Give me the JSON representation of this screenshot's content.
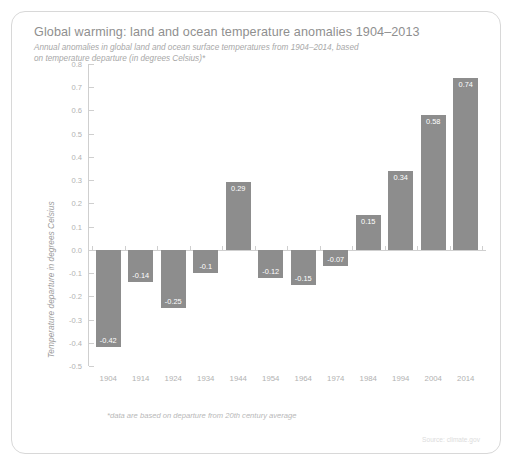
{
  "chart_data": {
    "type": "bar",
    "title": "Global warming: land and ocean temperature anomalies 1904–2013",
    "subtitle": "Annual anomalies in global land and ocean surface temperatures from 1904–2014, based on temperature departure (in degrees Celsius)*",
    "xlabel": "",
    "ylabel": "Temperature departure in degrees Celsius",
    "categories": [
      "1904",
      "1914",
      "1924",
      "1934",
      "1944",
      "1954",
      "1964",
      "1974",
      "1984",
      "1994",
      "2004",
      "2014"
    ],
    "values": [
      -0.42,
      -0.14,
      -0.25,
      -0.1,
      0.29,
      -0.12,
      -0.15,
      -0.07,
      0.15,
      0.34,
      0.58,
      0.74
    ],
    "value_labels": [
      "-0.42",
      "-0.14",
      "-0.25",
      "-0.1",
      "0.29",
      "-0.12",
      "-0.15",
      "-0.07",
      "0.15",
      "0.34",
      "0.58",
      "0.74"
    ],
    "ylim": [
      -0.5,
      0.8
    ],
    "ytick_labels": [
      "0.8",
      "0.7",
      "0.6",
      "0.5",
      "0.4",
      "0.3",
      "0.2",
      "0.1",
      "0.0",
      "-0.1",
      "-0.2",
      "-0.3",
      "-0.4",
      "-0.5"
    ],
    "ytick_values": [
      0.8,
      0.7,
      0.6,
      0.5,
      0.4,
      0.3,
      0.2,
      0.1,
      0.0,
      -0.1,
      -0.2,
      -0.3,
      -0.4,
      -0.5
    ],
    "grid": false,
    "legend": false,
    "bar_color": "#8d8d8d",
    "value_label_color": "#ffffff",
    "axis_color": "#cfcfcf",
    "tick_label_color": "#b2b2b2"
  },
  "footnote": "*data are based on departure from 20th century average",
  "source": "Source: climate.gov"
}
